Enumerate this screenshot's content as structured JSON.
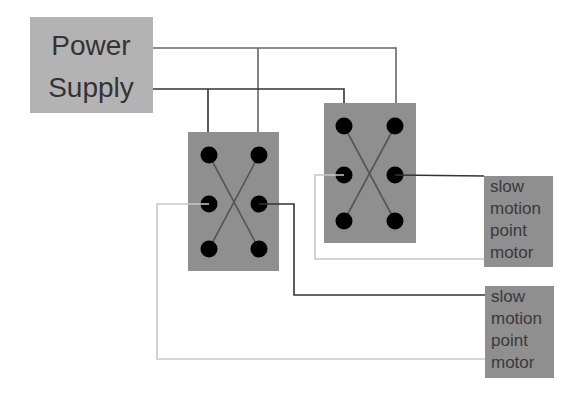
{
  "diagram": {
    "colors": {
      "background": "#ffffff",
      "power_supply_fill": "#b3b3b3",
      "switch_fill": "#8f8f8f",
      "motor_fill": "#8f8f8f",
      "terminal": "#000000",
      "wire_dark": "#333333",
      "wire_mid": "#666666",
      "wire_light": "#c8c8c8",
      "text": "#333333"
    },
    "power_supply": {
      "label_line1": "Power",
      "label_line2": "Supply"
    },
    "switches": [
      {
        "id": "switch-left",
        "type": "DPDT crossover"
      },
      {
        "id": "switch-right",
        "type": "DPDT crossover"
      }
    ],
    "motors": [
      {
        "id": "motor-1",
        "lines": [
          "slow",
          "motion",
          "point",
          "motor"
        ]
      },
      {
        "id": "motor-2",
        "lines": [
          "slow",
          "motion",
          "point",
          "motor"
        ]
      }
    ]
  }
}
